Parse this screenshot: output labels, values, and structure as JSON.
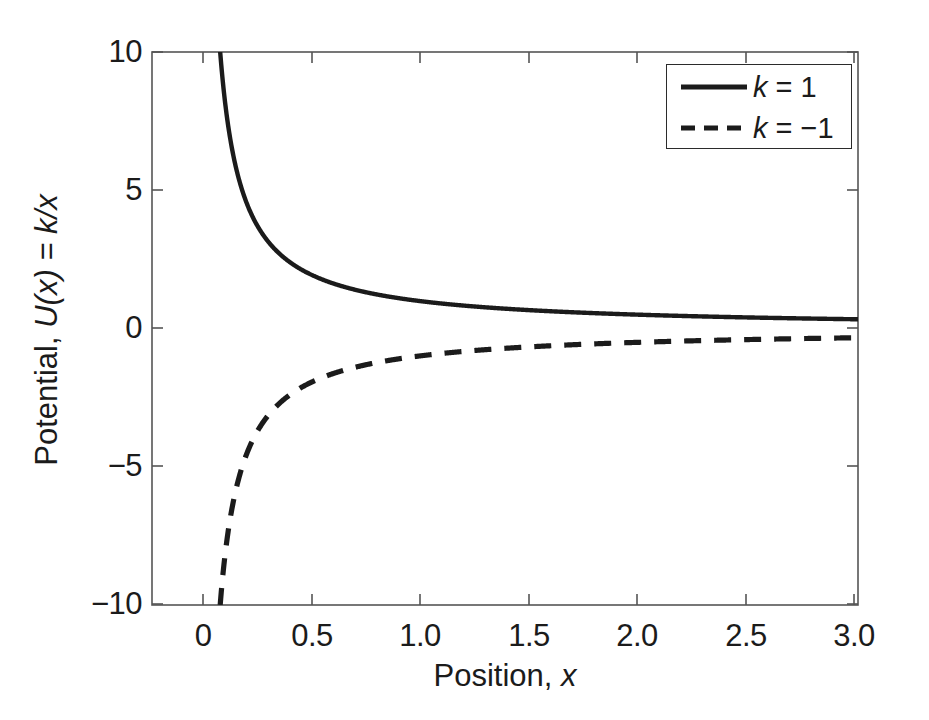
{
  "figure": {
    "background_color": "#ffffff",
    "axis_color": "#4d4d4d",
    "line_color": "#1b1b1b"
  },
  "axes": {
    "x_title_plain": "Position, ",
    "x_title_italic": "x",
    "y_title_plain": "Potential, ",
    "y_title_italic": "U(x) = k/x",
    "x_ticks": [
      "0",
      "0.5",
      "1.0",
      "1.5",
      "2.0",
      "2.5",
      "3.0"
    ],
    "y_ticks": [
      "10",
      "5",
      "0",
      "−5",
      "−10"
    ]
  },
  "legend": {
    "entries": [
      {
        "label_plain_1": "k",
        "label_plain_2": " = 1",
        "style": "solid"
      },
      {
        "label_plain_1": "k",
        "label_plain_2": " = −1",
        "style": "dashed"
      }
    ],
    "item0_k": "k",
    "item0_rest": " = 1",
    "item1_k": "k",
    "item1_rest": " = −1"
  },
  "chart_data": {
    "type": "line",
    "title": "",
    "xlabel": "Position, x",
    "ylabel": "Potential, U(x) = k/x",
    "xlim": [
      -0.21,
      3.0
    ],
    "ylim": [
      -10,
      10
    ],
    "xticks": [
      0,
      0.5,
      1.0,
      1.5,
      2.0,
      2.5,
      3.0
    ],
    "yticks": [
      10,
      5,
      0,
      -5,
      -10
    ],
    "grid": false,
    "legend_position": "upper right",
    "function": "U(x) = k / x",
    "series": [
      {
        "name": "k = 1",
        "k": 1,
        "style": "solid",
        "linewidth": 4,
        "color": "#1b1b1b",
        "x": [
          0.1,
          0.12,
          0.15,
          0.18,
          0.2,
          0.25,
          0.3,
          0.35,
          0.4,
          0.5,
          0.6,
          0.7,
          0.8,
          0.9,
          1.0,
          1.2,
          1.4,
          1.6,
          1.8,
          2.0,
          2.2,
          2.4,
          2.6,
          2.8,
          3.0
        ],
        "y": [
          10.0,
          8.33,
          6.67,
          5.56,
          5.0,
          4.0,
          3.33,
          2.86,
          2.5,
          2.0,
          1.67,
          1.43,
          1.25,
          1.11,
          1.0,
          0.83,
          0.71,
          0.63,
          0.56,
          0.5,
          0.45,
          0.42,
          0.38,
          0.36,
          0.33
        ]
      },
      {
        "name": "k = -1",
        "k": -1,
        "style": "dashed",
        "linewidth": 5,
        "color": "#1b1b1b",
        "x": [
          0.1,
          0.12,
          0.15,
          0.18,
          0.2,
          0.25,
          0.3,
          0.35,
          0.4,
          0.5,
          0.6,
          0.7,
          0.8,
          0.9,
          1.0,
          1.2,
          1.4,
          1.6,
          1.8,
          2.0,
          2.2,
          2.4,
          2.6,
          2.8,
          3.0
        ],
        "y": [
          -10.0,
          -8.33,
          -6.67,
          -5.56,
          -5.0,
          -4.0,
          -3.33,
          -2.86,
          -2.5,
          -2.0,
          -1.67,
          -1.43,
          -1.25,
          -1.11,
          -1.0,
          -0.83,
          -0.71,
          -0.63,
          -0.56,
          -0.5,
          -0.45,
          -0.42,
          -0.38,
          -0.36,
          -0.33
        ]
      }
    ]
  }
}
